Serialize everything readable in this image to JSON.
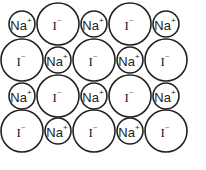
{
  "diagram": {
    "labels": {
      "na": "Na",
      "na_charge": "+",
      "i": "I",
      "i_charge": "−"
    },
    "rows": [
      [
        "na",
        "i",
        "na",
        "i",
        "na"
      ],
      [
        "i",
        "na",
        "i",
        "na",
        "i"
      ],
      [
        "na",
        "i",
        "na",
        "i",
        "na"
      ],
      [
        "i",
        "na",
        "i",
        "na",
        "i"
      ]
    ],
    "geometry": {
      "col_x": [
        22,
        58,
        94,
        130,
        166
      ],
      "row_y": [
        24,
        60,
        96,
        131
      ],
      "na_radius": 13,
      "i_radius": 21
    },
    "colors": {
      "stroke": "#222222",
      "fill": "#ffffff",
      "text": "#222222"
    }
  }
}
